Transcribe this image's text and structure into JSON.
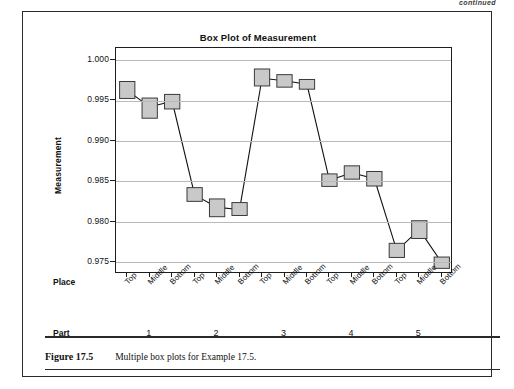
{
  "page": {
    "continued_note": "continued"
  },
  "figure": {
    "caption_label": "Figure 17.5",
    "caption_text": "Multiple box plots for Example 17.5."
  },
  "chart_data": {
    "type": "box",
    "title": "Box Plot of Measurement",
    "ylabel": "Measurement",
    "xlabel": "",
    "ylim": [
      0.9735,
      1.0015
    ],
    "yticks": [
      1.0,
      0.995,
      0.99,
      0.985,
      0.98,
      0.975
    ],
    "ytick_labels": [
      "1.000",
      "0.995",
      "0.990",
      "0.985",
      "0.980",
      "0.975"
    ],
    "grid": true,
    "grid_axis": "y",
    "legend": "none",
    "group_axis_label": "Place",
    "outer_axis_label": "Part",
    "categories": [
      "Top",
      "Middle",
      "Bottom"
    ],
    "groups": [
      "1",
      "2",
      "3",
      "4",
      "5"
    ],
    "box_fill": "#c9c9c9",
    "box_edge": "#3a3a3a",
    "connect_line_color": "#111111",
    "boxes": [
      {
        "part": "1",
        "place": "Top",
        "q1": 0.99525,
        "q3": 0.99735,
        "median": 0.99625
      },
      {
        "part": "1",
        "place": "Middle",
        "q1": 0.9928,
        "q3": 0.9953,
        "median": 0.9942
      },
      {
        "part": "1",
        "place": "Bottom",
        "q1": 0.99395,
        "q3": 0.99575,
        "median": 0.9949
      },
      {
        "part": "2",
        "place": "Top",
        "q1": 0.9825,
        "q3": 0.9842,
        "median": 0.9833
      },
      {
        "part": "2",
        "place": "Middle",
        "q1": 0.9806,
        "q3": 0.9828,
        "median": 0.98175
      },
      {
        "part": "2",
        "place": "Bottom",
        "q1": 0.98075,
        "q3": 0.98235,
        "median": 0.9815
      },
      {
        "part": "3",
        "place": "Top",
        "q1": 0.9968,
        "q3": 0.9989,
        "median": 0.99775
      },
      {
        "part": "3",
        "place": "Middle",
        "q1": 0.99665,
        "q3": 0.9982,
        "median": 0.99745
      },
      {
        "part": "3",
        "place": "Bottom",
        "q1": 0.9964,
        "q3": 0.9976,
        "median": 0.997
      },
      {
        "part": "4",
        "place": "Top",
        "q1": 0.98435,
        "q3": 0.9859,
        "median": 0.9851
      },
      {
        "part": "4",
        "place": "Middle",
        "q1": 0.98525,
        "q3": 0.9869,
        "median": 0.98605
      },
      {
        "part": "4",
        "place": "Bottom",
        "q1": 0.9844,
        "q3": 0.9862,
        "median": 0.9853
      },
      {
        "part": "5",
        "place": "Top",
        "q1": 0.97555,
        "q3": 0.9773,
        "median": 0.9764
      },
      {
        "part": "5",
        "place": "Middle",
        "q1": 0.9779,
        "q3": 0.9801,
        "median": 0.979
      },
      {
        "part": "5",
        "place": "Bottom",
        "q1": 0.9742,
        "q3": 0.9756,
        "median": 0.9749
      }
    ]
  }
}
